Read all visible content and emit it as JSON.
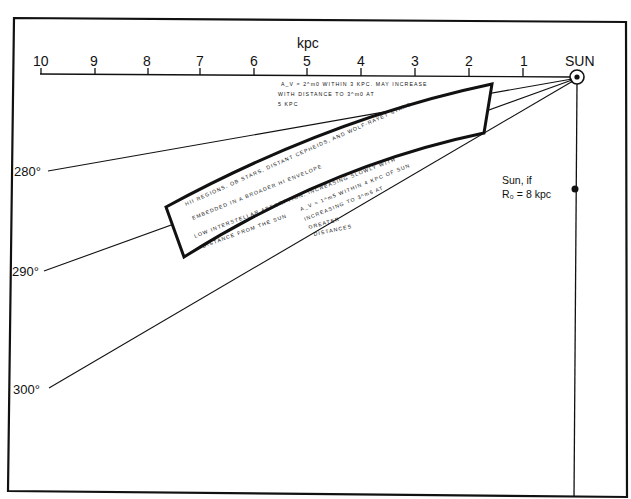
{
  "axis": {
    "unit_label": "kpc",
    "ticks": [
      "10",
      "9",
      "8",
      "7",
      "6",
      "5",
      "4",
      "3",
      "2",
      "1"
    ],
    "sun_label": "SUN"
  },
  "longitudes": [
    "280°",
    "290°",
    "300°"
  ],
  "annotations": {
    "top_note": [
      "A_V ≈ 2^m0 WITHIN 3 KPC. MAY INCREASE",
      "WITH DISTANCE TO 3^m0 AT",
      "5 KPC"
    ],
    "band_text": [
      "HII REGIONS, OB STARS, DISTANT CEPHEIDS, AND WOLF-RAYET STARS",
      "EMBEDDED IN A BROADER HI ENVELOPE",
      "LOW INTERSTELLAR ABSORPTION, INCREASING SLOWLY WITH",
      "DISTANCE FROM THE SUN"
    ],
    "lower_note": [
      "A_V ≈ 1^m5 WITHIN 4 KPC OF SUN",
      "INCREASING TO 3^m5 AT",
      "GREATER",
      "DISTANCES"
    ],
    "sun_alt": [
      "Sun, if",
      "R₀ = 8 kpc"
    ]
  },
  "colors": {
    "ink": "#111111",
    "paper": "#ffffff"
  }
}
